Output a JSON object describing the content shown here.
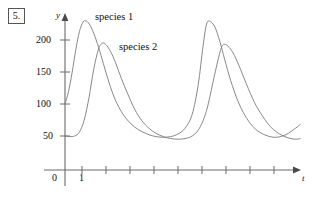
{
  "figure": {
    "problem_number": "5.",
    "y_axis_name": "y",
    "x_axis_name": "t"
  },
  "chart_data": {
    "type": "line",
    "title": "",
    "subtitle": "",
    "xlabel": "t",
    "ylabel": "y",
    "grid": false,
    "legend_position": "inline-annotation",
    "xlim": [
      0,
      10
    ],
    "ylim": [
      0,
      250
    ],
    "x_ticks": [
      0,
      1,
      2,
      3,
      4,
      5,
      6,
      7,
      8,
      9,
      10
    ],
    "x_tick_labels": [
      "0",
      "1",
      "",
      "",
      "",
      "",
      "",
      "",
      "",
      "",
      ""
    ],
    "y_ticks": [
      50,
      100,
      150,
      200
    ],
    "y_tick_labels": [
      "50",
      "100",
      "150",
      "200"
    ],
    "annotations": [
      {
        "text": "species 1",
        "x": 1.4,
        "y": 240
      },
      {
        "text": "species 2",
        "x": 2.4,
        "y": 198
      }
    ],
    "series": [
      {
        "name": "species 1",
        "label": "species 1",
        "color": "#7a7a7a",
        "initial_value": 100,
        "peak_values": [
          230,
          230
        ],
        "trough_values": [
          48,
          48
        ],
        "peak_times": [
          0.85,
          5.9
        ],
        "period": 5.05,
        "x": [
          0.0,
          0.15,
          0.3,
          0.45,
          0.6,
          0.75,
          0.85,
          0.95,
          1.1,
          1.3,
          1.5,
          1.7,
          1.9,
          2.1,
          2.35,
          2.6,
          2.9,
          3.2,
          3.5,
          3.8,
          4.1,
          4.4,
          4.7,
          5.0,
          5.3,
          5.55,
          5.75,
          5.9,
          6.05,
          6.25,
          6.45,
          6.65,
          6.9,
          7.2,
          7.5,
          7.8,
          8.1,
          8.45,
          8.8,
          9.2,
          9.6,
          9.8
        ],
        "y": [
          100,
          120,
          150,
          185,
          213,
          228,
          230,
          228,
          219,
          200,
          176,
          150,
          126,
          106,
          88,
          75,
          64,
          57,
          52,
          49,
          48,
          49,
          53,
          62,
          84,
          130,
          190,
          225,
          229,
          220,
          198,
          170,
          137,
          105,
          82,
          66,
          56,
          50,
          48,
          52,
          62,
          68
        ]
      },
      {
        "name": "species 2",
        "label": "species 2",
        "color": "#7a7a7a",
        "initial_value": 50,
        "peak_values": [
          195,
          193
        ],
        "trough_values": [
          45,
          45
        ],
        "peak_times": [
          1.55,
          6.6
        ],
        "period": 5.05,
        "x": [
          0.0,
          0.2,
          0.4,
          0.6,
          0.8,
          1.0,
          1.2,
          1.4,
          1.55,
          1.7,
          1.9,
          2.1,
          2.35,
          2.6,
          2.9,
          3.2,
          3.5,
          3.8,
          4.1,
          4.4,
          4.7,
          5.0,
          5.3,
          5.6,
          5.9,
          6.2,
          6.45,
          6.6,
          6.8,
          7.0,
          7.25,
          7.55,
          7.9,
          8.25,
          8.6,
          8.95,
          9.3,
          9.6,
          9.8
        ],
        "y": [
          50,
          49,
          50,
          56,
          75,
          110,
          155,
          186,
          195,
          193,
          182,
          165,
          140,
          117,
          92,
          74,
          62,
          54,
          49,
          46,
          45,
          46,
          50,
          62,
          90,
          140,
          180,
          193,
          190,
          180,
          160,
          132,
          102,
          80,
          63,
          53,
          47,
          45,
          46
        ]
      }
    ]
  }
}
